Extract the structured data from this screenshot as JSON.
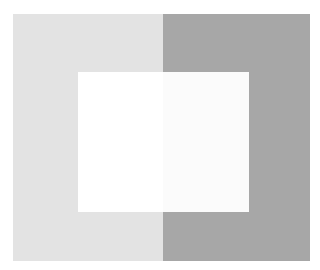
{
  "figure": {
    "type": "simultaneous-contrast-illusion",
    "background_color": "#ffffff",
    "left_panel": {
      "color": "#e3e3e3"
    },
    "right_panel": {
      "color": "#a7a7a7"
    },
    "center_rect": {
      "left_half_color": "#ffffff",
      "right_half_color": "#fbfbfb"
    }
  }
}
